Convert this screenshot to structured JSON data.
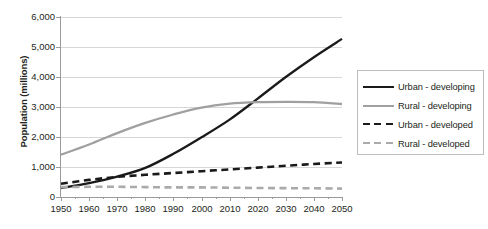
{
  "chart_data": {
    "type": "line",
    "title": "",
    "xlabel": "",
    "ylabel": "Population (millions)",
    "xlim": [
      1950,
      2050
    ],
    "ylim": [
      0,
      6000
    ],
    "ytick_labels": [
      "6,000",
      "5,000",
      "4,000",
      "3,000",
      "2,000",
      "1,000",
      "0"
    ],
    "ytick_values": [
      6000,
      5000,
      4000,
      3000,
      2000,
      1000,
      0
    ],
    "xtick_labels": [
      "1950",
      "1960",
      "1970",
      "1980",
      "1990",
      "2000",
      "2010",
      "2020",
      "2030",
      "2040",
      "2050"
    ],
    "xtick_values": [
      1950,
      1960,
      1970,
      1980,
      1990,
      2000,
      2010,
      2020,
      2030,
      2040,
      2050
    ],
    "minor_xticks": [
      1955,
      1965,
      1975,
      1985,
      1995,
      2005,
      2015,
      2025,
      2035,
      2045
    ],
    "grid": "horizontal",
    "legend_position": "right",
    "x": [
      1950,
      1960,
      1970,
      1980,
      1990,
      2000,
      2010,
      2020,
      2030,
      2040,
      2050
    ],
    "series": [
      {
        "name": "Urban - developing",
        "color": "#1a1a1a",
        "style": "solid",
        "values": [
          300,
          460,
          680,
          970,
          1440,
          1990,
          2580,
          3280,
          4000,
          4660,
          5270
        ]
      },
      {
        "name": "Rural - developing",
        "color": "#a0a0a0",
        "style": "solid",
        "values": [
          1410,
          1750,
          2130,
          2470,
          2750,
          2980,
          3110,
          3160,
          3170,
          3160,
          3100
        ]
      },
      {
        "name": "Urban - developed",
        "color": "#1a1a1a",
        "style": "dashed",
        "values": [
          440,
          570,
          670,
          740,
          800,
          860,
          920,
          980,
          1040,
          1100,
          1150
        ]
      },
      {
        "name": "Rural - developed",
        "color": "#aaaaaa",
        "style": "dashed",
        "values": [
          330,
          340,
          340,
          330,
          320,
          320,
          310,
          300,
          295,
          290,
          280
        ]
      }
    ]
  },
  "legend": {
    "items": [
      {
        "label": "Urban - developing",
        "color": "#1a1a1a",
        "style": "solid"
      },
      {
        "label": "Rural - developing",
        "color": "#a0a0a0",
        "style": "solid"
      },
      {
        "label": "Urban - developed",
        "color": "#1a1a1a",
        "style": "dashed"
      },
      {
        "label": "Rural - developed",
        "color": "#aaaaaa",
        "style": "dashed"
      }
    ]
  },
  "colors": {
    "grid": "#d6d6d6",
    "axis": "#9a9a9a",
    "text": "#231f20",
    "background": "#ffffff"
  }
}
